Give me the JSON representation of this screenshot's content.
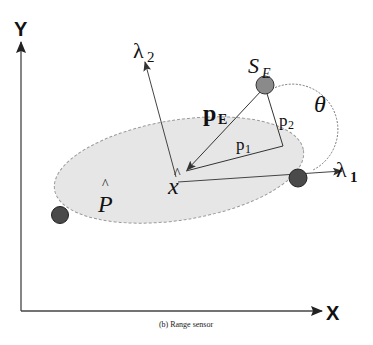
{
  "diagram": {
    "caption": "(b) Range sensor",
    "axes": {
      "x_label": "X",
      "y_label": "Y"
    },
    "ellipse": {
      "label": "P",
      "label_accent": "^",
      "fill": "#e6e6e6",
      "stroke": "#9a9a9a"
    },
    "center_point": {
      "label": "x",
      "label_accent": "^"
    },
    "eigen_axes": {
      "lambda1_main": "λ",
      "lambda1_sub": "1",
      "lambda2_main": "λ",
      "lambda2_sub": "2"
    },
    "sensor": {
      "label_main": "S",
      "label_sub": "E",
      "fill": "#8a8a8a"
    },
    "vectors": {
      "pE_main": "p",
      "pE_sub": "E",
      "p1_main": "p",
      "p1_sub": "1",
      "p2_main": "p",
      "p2_sub": "2"
    },
    "angle": {
      "label": "θ"
    },
    "endpoint_color": "#4a4a4a",
    "line_color": "#333333"
  }
}
